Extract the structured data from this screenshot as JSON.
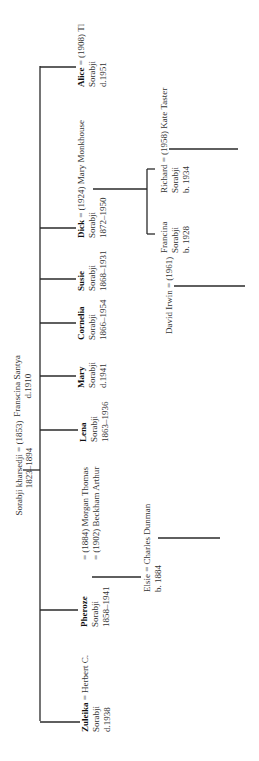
{
  "diagram": {
    "type": "family-tree",
    "orientation": "rotated-90-ccw",
    "parents": {
      "line1": "Sorabji kharsedji = (1853)",
      "line2": "1823–1894",
      "spouse_line1": "Franscina Santya",
      "spouse_line2": "d.1910"
    },
    "children": [
      {
        "name": "Alice",
        "rest": " = (1908)  Tl",
        "line2": "Sorabji",
        "line3": "d.1951"
      },
      {
        "name": "Dick",
        "rest": " = (1924)  Mary Monkhouse",
        "line2": "Sorabji",
        "line3": "1872–1950"
      },
      {
        "name": "Susie",
        "rest": "",
        "line2": "Sorabji",
        "line3": "1868–1931"
      },
      {
        "name": "Cornelia",
        "rest": "",
        "line2": "Sorabji",
        "line3": "1866–1954"
      },
      {
        "name": "Mary",
        "rest": "",
        "line2": "Sorabji",
        "line3": "d.1941"
      },
      {
        "name": "Lena",
        "rest": "",
        "line2": "Sorabji",
        "line3": "1863–1936"
      },
      {
        "name": "Pheroze",
        "rest": "",
        "line2": "Sorabji",
        "line3": "1858–1941"
      },
      {
        "name": "Zuleika",
        "rest": " = Herbert C.",
        "line2": "Sorabji",
        "line3": "d.1938"
      }
    ],
    "pheroze_marriages": {
      "line1": "= (1884)  Morgan Thomas",
      "line2": "= (1902)  Beckham Arthur"
    },
    "grandchildren": {
      "elsie": {
        "line1": "Elsie = Charles Dunman",
        "line2": "b. 1884"
      },
      "francina": {
        "line1": "Francina",
        "line2": "Sorabji",
        "line3": "b. 1928"
      },
      "richard": {
        "line1": "Richard = (1958) Kate Taster",
        "line2": "Sorabji",
        "line3": "b. 1934"
      },
      "david": {
        "line1": "David Irwin = (1961)"
      }
    }
  }
}
